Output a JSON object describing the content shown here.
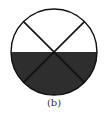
{
  "figure": {
    "caption": "(b)",
    "shape": "circle divided by two diagonals, lower half shaded",
    "colors": {
      "shaded": "#2e2e2e",
      "outline": "#111111",
      "background": "#ffffff"
    },
    "shaded_fraction": "1/2"
  }
}
